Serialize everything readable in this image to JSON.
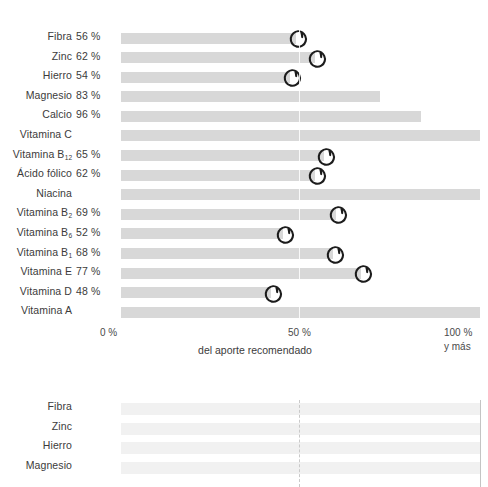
{
  "chart_data": [
    {
      "type": "bar",
      "orientation": "horizontal",
      "title": "",
      "xlabel": "del aporte recomendado",
      "ylabel": "",
      "xlim": [
        0,
        115
      ],
      "grid": true,
      "gridlines": [
        50
      ],
      "xticks": [
        "0 %",
        "50 %",
        "100 %"
      ],
      "xtick_extra": "y más",
      "categories": [
        "Fibra",
        "Zinc",
        "Hierro",
        "Magnesio",
        "Calcio",
        "Vitamina C",
        "Vitamina B₁₂",
        "Ácido fólico",
        "Niacina",
        "Vitamina B₂",
        "Vitamina B₆",
        "Vitamina B₁",
        "Vitamina E",
        "Vitamina D",
        "Vitamina A"
      ],
      "values": [
        56,
        62,
        54,
        83,
        96,
        115,
        65,
        62,
        115,
        69,
        52,
        68,
        77,
        48,
        115
      ],
      "value_labels": [
        "56 %",
        "62 %",
        "54 %",
        "83 %",
        "96 %",
        "",
        "65 %",
        "62 %",
        "",
        "69 %",
        "52 %",
        "68 %",
        "77 %",
        "48 %",
        ""
      ],
      "annotated": [
        true,
        true,
        true,
        false,
        false,
        false,
        true,
        true,
        false,
        true,
        true,
        true,
        true,
        true,
        false
      ],
      "bar_color": "#d8d8d8",
      "marker": "hand-drawn-circle",
      "marker_color": "#1c1c1c"
    },
    {
      "type": "bar",
      "orientation": "horizontal",
      "title": "",
      "xlabel": "",
      "ylabel": "",
      "xlim": [
        0,
        115
      ],
      "grid": true,
      "gridlines": [
        50
      ],
      "categories": [
        "Fibra",
        "Zinc",
        "Hierro",
        "Magnesio"
      ],
      "values": [
        115,
        115,
        115,
        115
      ],
      "value_labels": [
        "",
        "",
        "",
        ""
      ],
      "bar_color": "#f1f1f1",
      "note": "second chart, cropped at bottom edge of the screenshot"
    }
  ],
  "chart_top": {
    "rows": [
      {
        "label_main": "Fibra",
        "label_sub": "",
        "value": "56 %",
        "pct": 56,
        "marked": true
      },
      {
        "label_main": "Zinc",
        "label_sub": "",
        "value": "62 %",
        "pct": 62,
        "marked": true
      },
      {
        "label_main": "Hierro",
        "label_sub": "",
        "value": "54 %",
        "pct": 54,
        "marked": true
      },
      {
        "label_main": "Magnesio",
        "label_sub": "",
        "value": "83 %",
        "pct": 83,
        "marked": false
      },
      {
        "label_main": "Calcio",
        "label_sub": "",
        "value": "96 %",
        "pct": 96,
        "marked": false
      },
      {
        "label_main": "Vitamina C",
        "label_sub": "",
        "value": "",
        "pct": 115,
        "marked": false
      },
      {
        "label_main": "Vitamina B",
        "label_sub": "12",
        "value": "65 %",
        "pct": 65,
        "marked": true
      },
      {
        "label_main": "Ácido fólico",
        "label_sub": "",
        "value": "62 %",
        "pct": 62,
        "marked": true
      },
      {
        "label_main": "Niacina",
        "label_sub": "",
        "value": "",
        "pct": 115,
        "marked": false
      },
      {
        "label_main": "Vitamina B",
        "label_sub": "2",
        "value": "69 %",
        "pct": 69,
        "marked": true
      },
      {
        "label_main": "Vitamina B",
        "label_sub": "6",
        "value": "52 %",
        "pct": 52,
        "marked": true
      },
      {
        "label_main": "Vitamina B",
        "label_sub": "1",
        "value": "68 %",
        "pct": 68,
        "marked": true
      },
      {
        "label_main": "Vitamina E",
        "label_sub": "",
        "value": "77 %",
        "pct": 77,
        "marked": true
      },
      {
        "label_main": "Vitamina D",
        "label_sub": "",
        "value": "48 %",
        "pct": 48,
        "marked": true
      },
      {
        "label_main": "Vitamina A",
        "label_sub": "",
        "value": "",
        "pct": 115,
        "marked": false
      }
    ],
    "axis": {
      "tick_0": "0 %",
      "tick_50": "50 %",
      "tick_100": "100 %",
      "tick_100_sub": "y más",
      "caption": "del aporte recomendado"
    }
  },
  "chart_bottom": {
    "rows": [
      {
        "label_main": "Fibra",
        "label_sub": "",
        "value": "",
        "pct": 115,
        "marked": false
      },
      {
        "label_main": "Zinc",
        "label_sub": "",
        "value": "",
        "pct": 115,
        "marked": false
      },
      {
        "label_main": "Hierro",
        "label_sub": "",
        "value": "",
        "pct": 115,
        "marked": false
      },
      {
        "label_main": "Magnesio",
        "label_sub": "",
        "value": "",
        "pct": 115,
        "marked": false
      }
    ]
  },
  "colors": {
    "bar_top": "#d8d8d8",
    "bar_bottom": "#f1f1f1",
    "text": "#3b3b3b",
    "marker": "#1c1c1c",
    "gridline": "#c9c9c9",
    "background": "#ffffff"
  }
}
